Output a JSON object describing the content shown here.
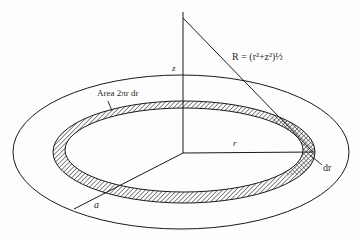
{
  "figure": {
    "labels": {
      "z_axis": "z",
      "radius_r": "r",
      "outer_radius": "a",
      "ring_width": "dr",
      "ring_area": "Area 2πr dr",
      "distance_formula": "R = (r²+z²)½"
    },
    "colors": {
      "stroke": "#1a1a1a",
      "background": "#fdfdfd",
      "hatch": "#2a2a2a"
    }
  }
}
